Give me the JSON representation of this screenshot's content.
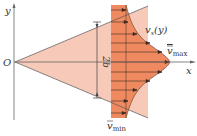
{
  "figure": {
    "type": "jet velocity profile diagram",
    "axes": {
      "x_label": "x",
      "y_label": "y",
      "origin_label": "O"
    },
    "dimension": {
      "label": "2b"
    },
    "profile": {
      "curve_label": "v_x(y)",
      "curve_label_main": "v",
      "curve_label_sub": "x",
      "curve_label_arg": "(y)",
      "max_label_main": "v",
      "max_label_sub": "max",
      "min_label_main": "v",
      "min_label_sub": "min"
    },
    "colors": {
      "jet_fill": "#f6c9b8",
      "profile_fill": "#ee8a62",
      "band_fill": "#f08a60",
      "axis": "#555555",
      "line": "#444444",
      "arrow": "#3a2a22"
    }
  }
}
